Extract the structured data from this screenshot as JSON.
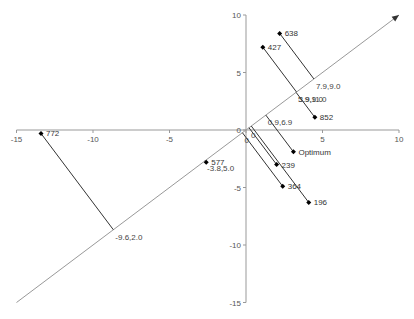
{
  "chart_data": {
    "type": "scatter",
    "title": "",
    "xlabel": "",
    "ylabel": "",
    "xlim": [
      -15,
      10
    ],
    "ylim": [
      -15,
      10
    ],
    "grid": false,
    "x_ticks": [
      -15,
      -10,
      -5,
      0,
      5,
      10
    ],
    "y_ticks": [
      10,
      5,
      0,
      -5,
      -10,
      -15
    ],
    "diagonal_axis": {
      "from": [
        -15,
        -15
      ],
      "to": [
        10,
        10
      ],
      "arrow": true
    },
    "points": [
      {
        "label": "638",
        "x": 2.2,
        "y": 8.4,
        "projection_label": "7.9,9.0"
      },
      {
        "label": "427",
        "x": 1.1,
        "y": 7.2,
        "projection_label": "3.9,9.0"
      },
      {
        "label": "852",
        "x": 4.5,
        "y": 1.1,
        "projection_label": "5.9,11.0"
      },
      {
        "label": "Optimum",
        "x": 3.1,
        "y": -1.9,
        "projection_label": "0.9,6.9"
      },
      {
        "label": "239",
        "x": 2.0,
        "y": -3.0,
        "projection_label": "0"
      },
      {
        "label": "364",
        "x": 2.4,
        "y": -4.9,
        "projection_label": "0"
      },
      {
        "label": "196",
        "x": 4.1,
        "y": -6.3,
        "projection_label": ""
      },
      {
        "label": "577",
        "x": -2.6,
        "y": -2.8,
        "projection_label": "-3.8,5.0"
      },
      {
        "label": "772",
        "x": -13.4,
        "y": -0.3,
        "projection_label": "-9.6,2.0"
      }
    ]
  },
  "colors": {
    "axis": "#999999",
    "line": "#333333",
    "point": "#000000"
  }
}
